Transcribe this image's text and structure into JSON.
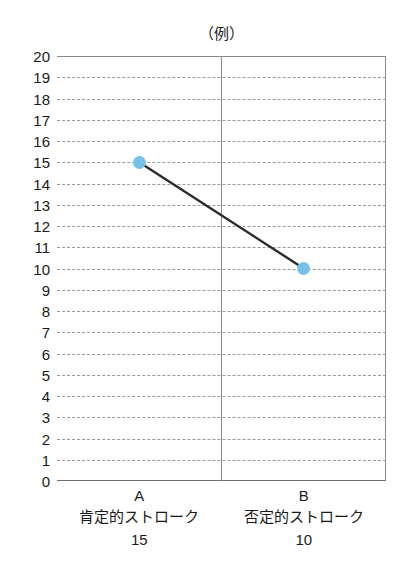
{
  "top_strip": {
    "faint_text": "——— —— — —— ———— ——— — ——"
  },
  "chart_data": {
    "type": "line",
    "title": "（例）",
    "xlabel": "",
    "ylabel": "",
    "ylim": [
      0,
      20
    ],
    "ytick_step": 1,
    "grid": true,
    "grid_style": "dashed",
    "legend": null,
    "legend_position": "none",
    "categories": [
      "A",
      "B"
    ],
    "category_names": [
      "肯定的ストローク",
      "否定的ストローク"
    ],
    "values": [
      15,
      10
    ],
    "value_labels": [
      "15",
      "10"
    ],
    "yticks": [
      "20",
      "19",
      "18",
      "17",
      "16",
      "15",
      "14",
      "13",
      "12",
      "11",
      "10",
      "9",
      "8",
      "7",
      "6",
      "5",
      "4",
      "3",
      "2",
      "1",
      "0"
    ],
    "series": [
      {
        "name": "ストローク",
        "values": [
          15,
          10
        ],
        "line_color": "#2b2b2b",
        "marker_color": "#77c0e8",
        "marker_shape": "circle"
      }
    ],
    "colors": {
      "marker": "#77c0e8",
      "line": "#2b2b2b",
      "grid": "#9a9a9a",
      "axis": "#8a8a8a",
      "text": "#1a1a1a",
      "background": "#ffffff"
    }
  }
}
